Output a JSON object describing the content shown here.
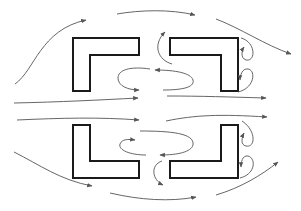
{
  "diagram": {
    "type": "airflow streamlines around four L-shaped obstacles",
    "colors": {
      "background": "#ffffff",
      "block_stroke": "#1a1a1a",
      "streamline": "#555555"
    },
    "blocks": [
      {
        "id": "top-left",
        "shape": "L (corner at top-left)"
      },
      {
        "id": "top-right",
        "shape": "L (corner at top-right)"
      },
      {
        "id": "bottom-left",
        "shape": "L (corner at bottom-left)"
      },
      {
        "id": "bottom-right",
        "shape": "L (corner at bottom-right)"
      }
    ],
    "streamline_count": 20
  }
}
